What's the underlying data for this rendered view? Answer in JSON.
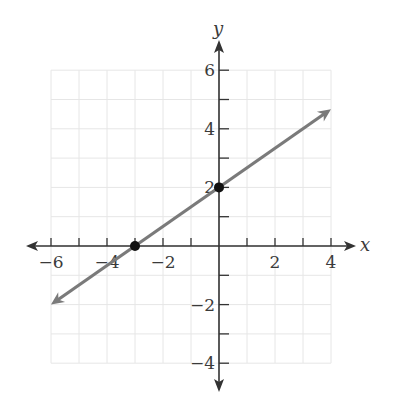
{
  "chart_data": {
    "type": "line",
    "title": "",
    "xlabel": "x",
    "ylabel": "y",
    "xlim": [
      -6,
      4
    ],
    "ylim": [
      -4,
      6
    ],
    "grid": true,
    "x_ticks": [
      -6,
      -4,
      -2,
      2,
      4
    ],
    "y_ticks": [
      6,
      4,
      2,
      -2,
      -4
    ],
    "x_tick_labels": [
      "−6",
      "−4",
      "−2",
      "2",
      "4"
    ],
    "y_tick_labels": [
      "6",
      "4",
      "2",
      "−2",
      "−4"
    ],
    "series": [
      {
        "name": "line",
        "equation": "y = (2/3)x + 2",
        "slope": 0.6667,
        "intercept": 2,
        "x": [
          -6,
          4
        ],
        "y": [
          -2,
          4.67
        ],
        "color": "#7a7a7a",
        "arrows": "both"
      }
    ],
    "points": [
      {
        "label": "x-intercept",
        "x": -3,
        "y": 0
      },
      {
        "label": "y-intercept",
        "x": 0,
        "y": 2
      }
    ]
  },
  "labels": {
    "x_axis": "x",
    "y_axis": "y"
  },
  "colors": {
    "line": "#7a7a7a",
    "axis": "#333333",
    "grid": "#e6e6e6",
    "point": "#111111"
  }
}
